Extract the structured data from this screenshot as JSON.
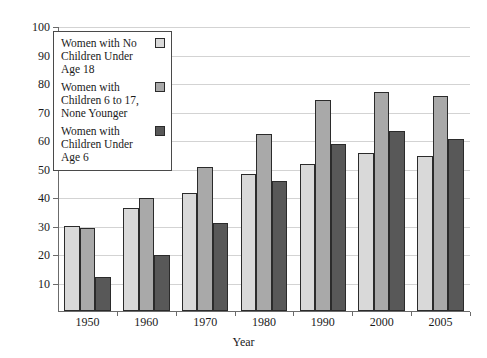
{
  "figure": {
    "top_remnant_text": "",
    "background": "#ffffff"
  },
  "legend": {
    "position": "upper-left-inside",
    "entries": [
      {
        "label": "Women with No Children Under Age 18",
        "color": "#d9d9d9",
        "icon": "legend-swatch-icon"
      },
      {
        "label": "Women with Children 6 to 17, None Younger",
        "color": "#a9a9a9",
        "icon": "legend-swatch-icon"
      },
      {
        "label": "Women with Children Under Age 6",
        "color": "#585858",
        "icon": "legend-swatch-icon"
      }
    ]
  },
  "axes": {
    "xlabel": "Year",
    "ylabel": "",
    "ytick_labels": [
      "100",
      "90",
      "80",
      "70",
      "60",
      "50",
      "40",
      "30",
      "20",
      "10"
    ],
    "xtick_labels": [
      "1950",
      "1960",
      "1970",
      "1980",
      "1990",
      "2000",
      "2005"
    ]
  },
  "chart_data": {
    "type": "bar",
    "title": "",
    "subtitle": "",
    "xlabel": "Year",
    "ylabel": "",
    "ylim": [
      0,
      100
    ],
    "ytick_step": 10,
    "grid": true,
    "legend_position": "upper left",
    "categories": [
      "1950",
      "1960",
      "1970",
      "1980",
      "1990",
      "2000",
      "2005"
    ],
    "series": [
      {
        "name": "Women with No Children Under Age 18",
        "color": "#d9d9d9",
        "values": [
          30,
          36,
          41.5,
          48,
          51.5,
          55.5,
          54.5
        ]
      },
      {
        "name": "Women with Children 6 to 17, None Younger",
        "color": "#a9a9a9",
        "values": [
          29,
          39.5,
          50.5,
          62,
          74,
          77,
          75.5
        ]
      },
      {
        "name": "Women with Children Under Age 6",
        "color": "#585858",
        "values": [
          12,
          19.5,
          31,
          45.5,
          58.5,
          63,
          60.5
        ]
      }
    ]
  }
}
